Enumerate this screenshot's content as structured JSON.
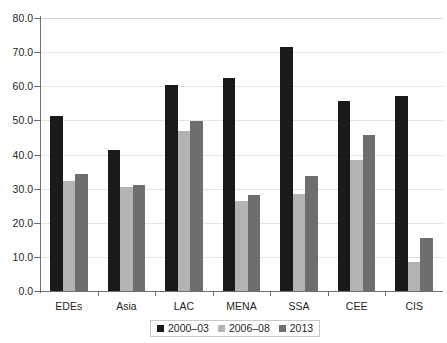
{
  "chart_data": {
    "type": "bar",
    "title": "",
    "subtitle": "",
    "xlabel": "",
    "ylabel": "",
    "categories": [
      "EDEs",
      "Asia",
      "LAC",
      "MENA",
      "SSA",
      "CEE",
      "CIS"
    ],
    "series": [
      {
        "name": "2000–03",
        "color": "#1a1a1a",
        "values": [
          51.3,
          41.3,
          60.4,
          62.4,
          71.5,
          55.7,
          57.1
        ]
      },
      {
        "name": "2006–08",
        "color": "#b3b3b3",
        "values": [
          32.2,
          30.5,
          46.9,
          26.4,
          28.4,
          38.4,
          8.5
        ]
      },
      {
        "name": "2013",
        "color": "#6e6e6e",
        "values": [
          34.3,
          31.1,
          49.8,
          28.1,
          33.7,
          45.7,
          15.5
        ]
      }
    ],
    "ylim": [
      0,
      80
    ],
    "ytick_values": [
      0,
      10,
      20,
      30,
      40,
      50,
      60,
      70,
      80
    ],
    "ytick_labels": [
      "0.0",
      "10.0",
      "20.0",
      "30.0",
      "40.0",
      "50.0",
      "60.0",
      "70.0",
      "80.0"
    ],
    "grid": true,
    "grid_axis": "y",
    "legend_position": "bottom-center",
    "legend_entries": [
      "2000–03",
      "2006–08",
      "2013"
    ]
  }
}
